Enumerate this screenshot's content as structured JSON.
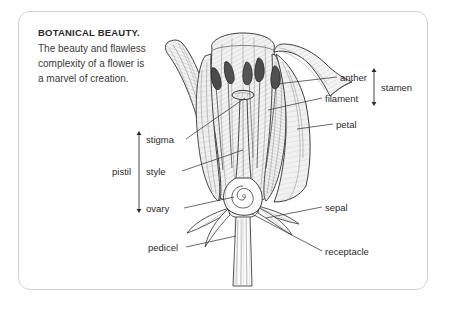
{
  "card": {
    "heading": "BOTANICAL BEAUTY.",
    "body_lines": [
      "The beauty and flawless",
      "complexity of a flower is",
      "a marvel of creation."
    ]
  },
  "illustration": {
    "subject": "cutaway-flower-diagram",
    "style": "pen-and-ink-hatching",
    "ink_color": "#3a3a3a",
    "fill_color": "#f4f4f4"
  },
  "labels": {
    "anther": "anther",
    "filament": "filament",
    "stamen": "stamen",
    "petal": "petal",
    "stigma": "stigma",
    "style": "style",
    "ovary": "ovary",
    "pistil": "pistil",
    "sepal": "sepal",
    "receptacle": "receptacle",
    "pedicel": "pedicel"
  }
}
